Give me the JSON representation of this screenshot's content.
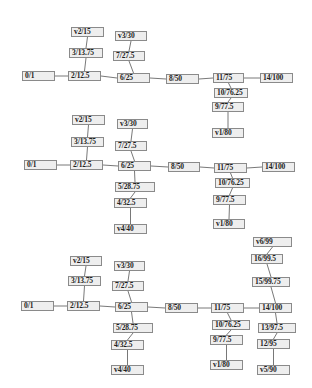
{
  "colors": {
    "node_fill": "#eeeeee",
    "node_border": "#8a8a8a",
    "edge": "#555555",
    "text": "#222222"
  },
  "graphs": [
    {
      "nodes": [
        {
          "id": "0/1",
          "label": "0/1",
          "x": 22,
          "y": 71,
          "w": 33
        },
        {
          "id": "2/12.5",
          "label": "2/12.5",
          "x": 68,
          "y": 71,
          "w": 33
        },
        {
          "id": "3/13.75",
          "label": "3/13.75",
          "x": 69,
          "y": 48,
          "w": 34
        },
        {
          "id": "v2/15",
          "label": "v2/15",
          "x": 71,
          "y": 27,
          "w": 33
        },
        {
          "id": "6/25",
          "label": "6/25",
          "x": 117,
          "y": 73,
          "w": 33
        },
        {
          "id": "7/27.5",
          "label": "7/27.5",
          "x": 113,
          "y": 51,
          "w": 32
        },
        {
          "id": "v3/30",
          "label": "v3/30",
          "x": 115,
          "y": 31,
          "w": 32
        },
        {
          "id": "8/50",
          "label": "8/50",
          "x": 166,
          "y": 74,
          "w": 33
        },
        {
          "id": "11/75",
          "label": "11/75",
          "x": 213,
          "y": 73,
          "w": 31
        },
        {
          "id": "14/100",
          "label": "14/100",
          "x": 260,
          "y": 73,
          "w": 33
        },
        {
          "id": "10/76.25",
          "label": "10/76.25",
          "x": 214,
          "y": 88,
          "w": 34
        },
        {
          "id": "9/77.5",
          "label": "9/77.5",
          "x": 212,
          "y": 102,
          "w": 32
        },
        {
          "id": "v1/80",
          "label": "v1/80",
          "x": 212,
          "y": 128,
          "w": 32
        }
      ],
      "edges": [
        [
          "0/1",
          "2/12.5"
        ],
        [
          "2/12.5",
          "3/13.75"
        ],
        [
          "3/13.75",
          "v2/15"
        ],
        [
          "2/12.5",
          "6/25"
        ],
        [
          "6/25",
          "7/27.5"
        ],
        [
          "7/27.5",
          "v3/30"
        ],
        [
          "6/25",
          "8/50"
        ],
        [
          "8/50",
          "11/75"
        ],
        [
          "11/75",
          "14/100"
        ],
        [
          "11/75",
          "10/76.25"
        ],
        [
          "10/76.25",
          "9/77.5"
        ],
        [
          "9/77.5",
          "v1/80"
        ]
      ]
    },
    {
      "nodes": [
        {
          "id": "0/1",
          "label": "0/1",
          "x": 24,
          "y": 160,
          "w": 33
        },
        {
          "id": "2/12.5",
          "label": "2/12.5",
          "x": 70,
          "y": 160,
          "w": 33
        },
        {
          "id": "3/13.75",
          "label": "3/13.75",
          "x": 71,
          "y": 137,
          "w": 33
        },
        {
          "id": "v2/15",
          "label": "v2/15",
          "x": 72,
          "y": 115,
          "w": 33
        },
        {
          "id": "6/25",
          "label": "6/25",
          "x": 118,
          "y": 161,
          "w": 33
        },
        {
          "id": "7/27.5",
          "label": "7/27.5",
          "x": 115,
          "y": 141,
          "w": 32
        },
        {
          "id": "v3/30",
          "label": "v3/30",
          "x": 117,
          "y": 119,
          "w": 31
        },
        {
          "id": "5/28.75",
          "label": "5/28.75",
          "x": 115,
          "y": 182,
          "w": 40
        },
        {
          "id": "4/32.5",
          "label": "4/32.5",
          "x": 114,
          "y": 198,
          "w": 33
        },
        {
          "id": "v4/40",
          "label": "v4/40",
          "x": 114,
          "y": 224,
          "w": 33
        },
        {
          "id": "8/50",
          "label": "8/50",
          "x": 168,
          "y": 162,
          "w": 32
        },
        {
          "id": "11/75",
          "label": "11/75",
          "x": 214,
          "y": 163,
          "w": 33
        },
        {
          "id": "14/100",
          "label": "14/100",
          "x": 262,
          "y": 162,
          "w": 33
        },
        {
          "id": "10/76.25",
          "label": "10/76.25",
          "x": 215,
          "y": 178,
          "w": 35
        },
        {
          "id": "9/77.5",
          "label": "9/77.5",
          "x": 213,
          "y": 195,
          "w": 33
        },
        {
          "id": "v1/80",
          "label": "v1/80",
          "x": 213,
          "y": 219,
          "w": 32
        }
      ],
      "edges": [
        [
          "0/1",
          "2/12.5"
        ],
        [
          "2/12.5",
          "3/13.75"
        ],
        [
          "3/13.75",
          "v2/15"
        ],
        [
          "2/12.5",
          "6/25"
        ],
        [
          "6/25",
          "7/27.5"
        ],
        [
          "7/27.5",
          "v3/30"
        ],
        [
          "6/25",
          "5/28.75"
        ],
        [
          "5/28.75",
          "4/32.5"
        ],
        [
          "4/32.5",
          "v4/40"
        ],
        [
          "6/25",
          "8/50"
        ],
        [
          "8/50",
          "11/75"
        ],
        [
          "11/75",
          "14/100"
        ],
        [
          "11/75",
          "10/76.25"
        ],
        [
          "10/76.25",
          "9/77.5"
        ],
        [
          "9/77.5",
          "v1/80"
        ]
      ]
    },
    {
      "nodes": [
        {
          "id": "0/1",
          "label": "0/1",
          "x": 21,
          "y": 301,
          "w": 33
        },
        {
          "id": "2/12.5",
          "label": "2/12.5",
          "x": 67,
          "y": 301,
          "w": 33
        },
        {
          "id": "3/13.75",
          "label": "3/13.75",
          "x": 68,
          "y": 276,
          "w": 33
        },
        {
          "id": "v2/15",
          "label": "v2/15",
          "x": 70,
          "y": 256,
          "w": 32
        },
        {
          "id": "6/25",
          "label": "6/25",
          "x": 115,
          "y": 302,
          "w": 33
        },
        {
          "id": "7/27.5",
          "label": "7/27.5",
          "x": 112,
          "y": 281,
          "w": 32
        },
        {
          "id": "v3/30",
          "label": "v3/30",
          "x": 114,
          "y": 261,
          "w": 31
        },
        {
          "id": "5/28.75",
          "label": "5/28.75",
          "x": 113,
          "y": 323,
          "w": 40
        },
        {
          "id": "4/32.5",
          "label": "4/32.5",
          "x": 111,
          "y": 340,
          "w": 33
        },
        {
          "id": "v4/40",
          "label": "v4/40",
          "x": 111,
          "y": 365,
          "w": 33
        },
        {
          "id": "8/50",
          "label": "8/50",
          "x": 165,
          "y": 303,
          "w": 33
        },
        {
          "id": "11/75",
          "label": "11/75",
          "x": 211,
          "y": 303,
          "w": 33
        },
        {
          "id": "10/76.25",
          "label": "10/76.25",
          "x": 212,
          "y": 320,
          "w": 38
        },
        {
          "id": "9/77.5",
          "label": "9/77.5",
          "x": 210,
          "y": 335,
          "w": 33
        },
        {
          "id": "v1/80",
          "label": "v1/80",
          "x": 210,
          "y": 360,
          "w": 33
        },
        {
          "id": "14/100",
          "label": "14/100",
          "x": 259,
          "y": 303,
          "w": 33
        },
        {
          "id": "15/99.75",
          "label": "15/99.75",
          "x": 252,
          "y": 277,
          "w": 38
        },
        {
          "id": "16/99.5",
          "label": "16/99.5",
          "x": 251,
          "y": 254,
          "w": 32
        },
        {
          "id": "v6/99",
          "label": "v6/99",
          "x": 253,
          "y": 237,
          "w": 39
        },
        {
          "id": "13/97.5",
          "label": "13/97.5",
          "x": 258,
          "y": 323,
          "w": 38
        },
        {
          "id": "12/95",
          "label": "12/95",
          "x": 257,
          "y": 339,
          "w": 33
        },
        {
          "id": "v5/90",
          "label": "v5/90",
          "x": 257,
          "y": 365,
          "w": 33
        }
      ],
      "edges": [
        [
          "0/1",
          "2/12.5"
        ],
        [
          "2/12.5",
          "3/13.75"
        ],
        [
          "3/13.75",
          "v2/15"
        ],
        [
          "2/12.5",
          "6/25"
        ],
        [
          "6/25",
          "7/27.5"
        ],
        [
          "7/27.5",
          "v3/30"
        ],
        [
          "6/25",
          "5/28.75"
        ],
        [
          "5/28.75",
          "4/32.5"
        ],
        [
          "4/32.5",
          "v4/40"
        ],
        [
          "6/25",
          "8/50"
        ],
        [
          "8/50",
          "11/75"
        ],
        [
          "11/75",
          "14/100"
        ],
        [
          "11/75",
          "10/76.25"
        ],
        [
          "10/76.25",
          "9/77.5"
        ],
        [
          "9/77.5",
          "v1/80"
        ],
        [
          "14/100",
          "15/99.75"
        ],
        [
          "15/99.75",
          "16/99.5"
        ],
        [
          "16/99.5",
          "v6/99"
        ],
        [
          "14/100",
          "13/97.5"
        ],
        [
          "13/97.5",
          "12/95"
        ],
        [
          "12/95",
          "v5/90"
        ]
      ]
    }
  ]
}
